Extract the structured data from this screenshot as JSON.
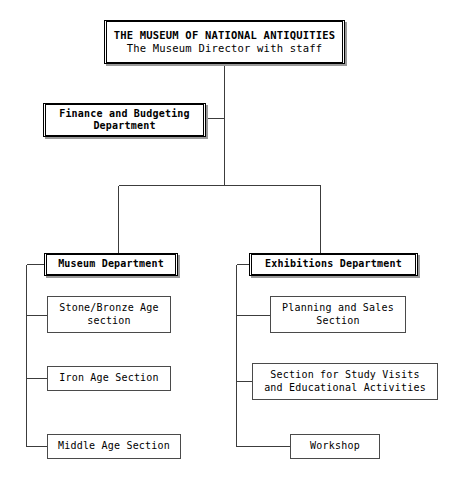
{
  "chart": {
    "type": "org-chart",
    "root": {
      "id": "museum-root",
      "line1": "THE MUSEUM OF NATIONAL ANTIQUITIES",
      "line2": "The Museum Director with staff",
      "style": "primary"
    },
    "staff_unit": {
      "id": "finance-budgeting",
      "line1": "Finance and Budgeting",
      "line2": "Department",
      "style": "primary"
    },
    "departments": [
      {
        "id": "museum-department",
        "line1": "Museum Department",
        "line2": "",
        "style": "primary",
        "sections": [
          {
            "id": "stone-bronze-age-section",
            "line1": "Stone/Bronze Age",
            "line2": "section",
            "style": "secondary"
          },
          {
            "id": "iron-age-section",
            "line1": "Iron Age Section",
            "line2": "",
            "style": "secondary"
          },
          {
            "id": "middle-age-section",
            "line1": "Middle Age Section",
            "line2": "",
            "style": "secondary"
          }
        ]
      },
      {
        "id": "exhibitions-department",
        "line1": "Exhibitions Department",
        "line2": "",
        "style": "primary",
        "sections": [
          {
            "id": "planning-and-sales-section",
            "line1": "Planning and Sales",
            "line2": "Section",
            "style": "secondary"
          },
          {
            "id": "study-visits-section",
            "line1": "Section for Study Visits",
            "line2": "and Educational Activities",
            "style": "secondary"
          },
          {
            "id": "workshop",
            "line1": "Workshop",
            "line2": "",
            "style": "secondary"
          }
        ]
      }
    ],
    "colors": {
      "line": "#3c3c3c",
      "box_border": "#000000",
      "section_border": "#4a4a4a",
      "shadow": "#9a9a9a",
      "background": "#ffffff",
      "text": "#000000"
    }
  }
}
